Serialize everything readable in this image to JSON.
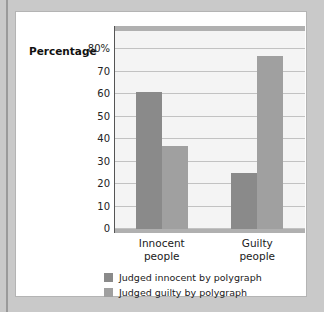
{
  "chart_data": {
    "type": "bar",
    "title": "",
    "xlabel": "",
    "ylabel": "Percentage",
    "ylim": [
      0,
      80
    ],
    "yticks": [
      "0",
      "10",
      "20",
      "30",
      "40",
      "50",
      "60",
      "70",
      "80%"
    ],
    "ytick_values": [
      0,
      10,
      20,
      30,
      40,
      50,
      60,
      70,
      80
    ],
    "grid": true,
    "legend_position": "bottom",
    "categories": [
      "Innocent people",
      "Guilty people"
    ],
    "category_lines": [
      [
        "Innocent",
        "people"
      ],
      [
        "Guilty",
        "people"
      ]
    ],
    "series": [
      {
        "name": "Judged innocent by polygraph",
        "color": "#8a8a8a",
        "values": [
          61,
          25
        ]
      },
      {
        "name": "Judged guilty by polygraph",
        "color": "#a0a0a0",
        "values": [
          37,
          77
        ]
      }
    ]
  },
  "legend": {
    "items": [
      {
        "label": "Judged innocent by polygraph",
        "color": "#8a8a8a"
      },
      {
        "label": "Judged guilty by polygraph",
        "color": "#a0a0a0"
      }
    ]
  },
  "colors": {
    "page_background": "#c9c9c9",
    "card_background": "#ffffff",
    "plot_background": "#f4f4f4",
    "gridline": "#c2c2c2",
    "axis": "#555555",
    "series_dark": "#8a8a8a",
    "series_light": "#a0a0a0"
  }
}
